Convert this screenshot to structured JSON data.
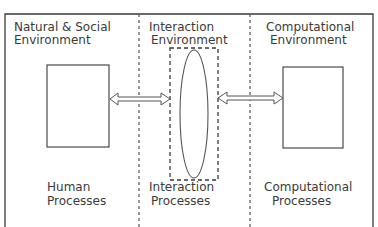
{
  "zones": [
    {
      "id": "natural-social",
      "title_line1": "Natural & Social",
      "title_line2": "Environment",
      "process_line1": "Human",
      "process_line2": "Processes"
    },
    {
      "id": "interaction",
      "title_line1": "Interaction",
      "title_line2": "Environment",
      "process_line1": "Interaction",
      "process_line2": "Processes"
    },
    {
      "id": "computational",
      "title_line1": "Computational",
      "title_line2": "Environment",
      "process_line1": "Computational",
      "process_line2": "Processes"
    }
  ],
  "colors": {
    "stroke": "#3a3a3a",
    "background": "#ffffff"
  }
}
